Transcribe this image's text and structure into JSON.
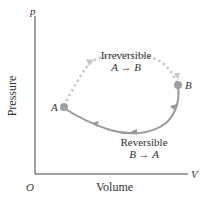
{
  "axes": {
    "y_symbol": "p",
    "x_symbol": "V",
    "origin": "O",
    "y_label": "Pressure",
    "x_label": "Volume"
  },
  "points": {
    "a": "A",
    "b": "B"
  },
  "paths": {
    "irreversible": {
      "line1": "Irreversible",
      "line2": "A → B",
      "style": "dotted",
      "color": "#c9c9c9"
    },
    "reversible": {
      "line1": "Reversible",
      "line2": "B → A",
      "style": "solid",
      "color": "#9a9a9a"
    }
  },
  "colors": {
    "axis": "#444444",
    "point": "#a0a0a0"
  }
}
